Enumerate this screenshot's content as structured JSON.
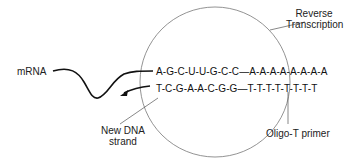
{
  "diagram": {
    "labels": {
      "reverse_transcription_line1": "Reverse",
      "reverse_transcription_line2": "Transcription",
      "mrna": "mRNA",
      "new_dna_line1": "New DNA",
      "new_dna_line2": "strand",
      "primer": "Oligo-T primer"
    },
    "sequences": {
      "mrna_strand": "A-G-C-U-U-G-C-C—A-A-A-A-A-A-A-A",
      "dna_strand": "T-C-G-A-A-C-G-G—T-T-T-T-T-T-T-T"
    },
    "colors": {
      "line": "#333333",
      "circle": "#666666",
      "text": "#222222"
    }
  }
}
